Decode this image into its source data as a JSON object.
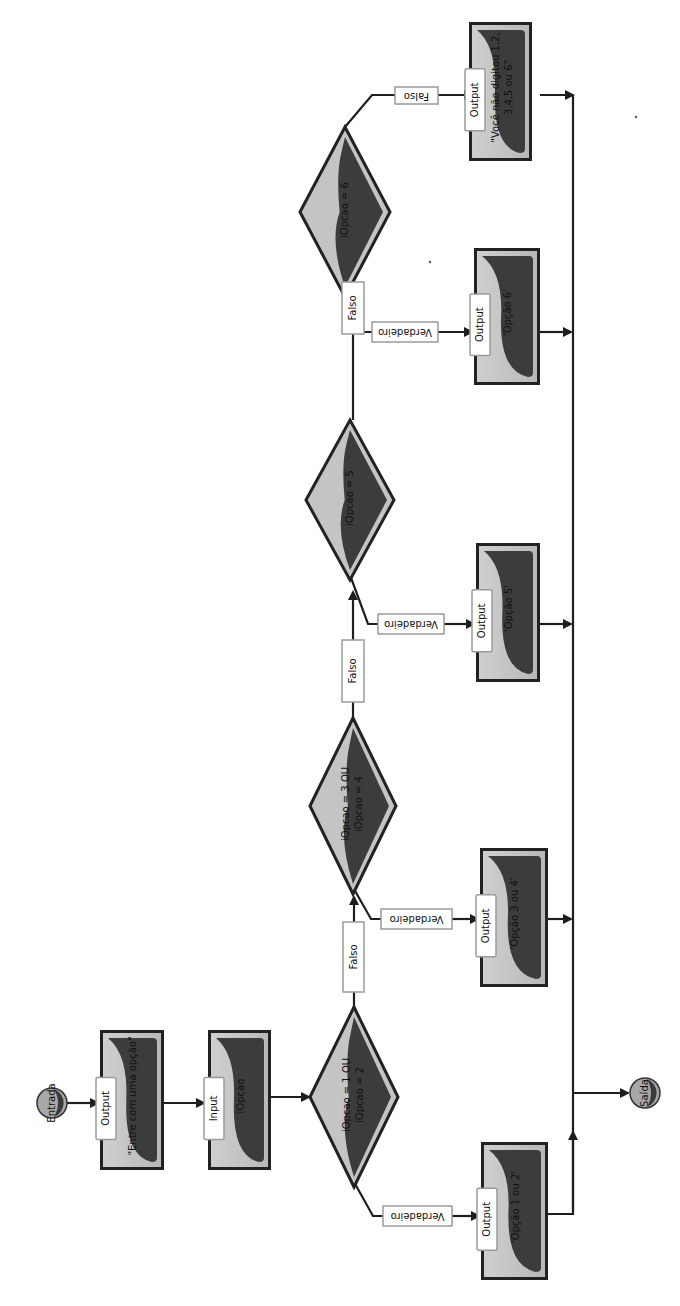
{
  "diagram": {
    "type": "flowchart",
    "orientation": "rotated-90-ccw",
    "colors": {
      "line": "#1e1e1e",
      "shape_fill_light": "#c4c4c4",
      "shape_fill_dark": "#3c3c3c",
      "shape_border": "#222222",
      "label_bg": "#ffffff",
      "label_border": "#9a9a9a"
    },
    "start": {
      "label": "Entrada"
    },
    "end": {
      "label": "Saída"
    },
    "steps": [
      {
        "id": "out1",
        "kind": "Output",
        "text": "\"Entre com uma opção\""
      },
      {
        "id": "in1",
        "kind": "Input",
        "text": "iOpcao"
      }
    ],
    "decisions": [
      {
        "id": "d1",
        "condition_line1": "iOpcao = 1 OU",
        "condition_line2": "iOpcao = 2",
        "true_label": "Verdadeiro",
        "false_label": "Falso"
      },
      {
        "id": "d2",
        "condition_line1": "iOpcao = 3 OU",
        "condition_line2": "iOpcao = 4",
        "true_label": "Verdadeiro",
        "false_label": "Falso"
      },
      {
        "id": "d3",
        "condition_line1": "iOpcao = 5",
        "condition_line2": "",
        "true_label": "Verdadeiro",
        "false_label": "Falso"
      },
      {
        "id": "d4",
        "condition_line1": "iOpcao = 6",
        "condition_line2": "",
        "true_label": "Verdadeiro",
        "false_label": "Falso"
      }
    ],
    "outputs": [
      {
        "id": "o12",
        "kind": "Output",
        "text_line1": "'Opção 1 ou 2'",
        "text_line2": ""
      },
      {
        "id": "o34",
        "kind": "Output",
        "text_line1": "'Opção 3 ou 4'",
        "text_line2": ""
      },
      {
        "id": "o5",
        "kind": "Output",
        "text_line1": "'Opção 5'",
        "text_line2": ""
      },
      {
        "id": "o6",
        "kind": "Output",
        "text_line1": "'Opção 6'",
        "text_line2": ""
      },
      {
        "id": "oelse",
        "kind": "Output",
        "text_line1": "\"Você não digitou 1,2,",
        "text_line2": "3,4,5 ou 6\""
      }
    ]
  }
}
